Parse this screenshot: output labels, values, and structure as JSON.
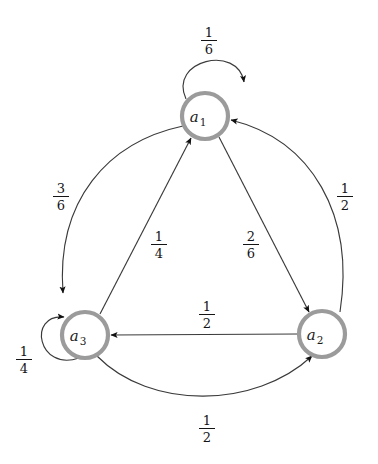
{
  "diagram": {
    "type": "state-transition-graph",
    "title": "",
    "node_style": {
      "ring_color": "#9b9b9b",
      "fill_color": "#ffffff",
      "radius": 23
    },
    "edge_color": "#3a3a3a",
    "background": "#ffffff",
    "nodes": [
      {
        "id": "a1",
        "label": "a",
        "subscript": "1",
        "cx": 205,
        "cy": 116
      },
      {
        "id": "a2",
        "label": "a",
        "subscript": "2",
        "cx": 322,
        "cy": 334
      },
      {
        "id": "a3",
        "label": "a",
        "subscript": "3",
        "cx": 85,
        "cy": 335
      }
    ],
    "edges": [
      {
        "from": "a1",
        "to": "a1",
        "kind": "self-loop",
        "numerator": "1",
        "denominator": "6",
        "label_x": 198,
        "label_y": 26
      },
      {
        "from": "a1",
        "to": "a3",
        "kind": "outer-arc",
        "numerator": "3",
        "denominator": "6",
        "label_x": 50,
        "label_y": 182
      },
      {
        "from": "a2",
        "to": "a1",
        "kind": "outer-arc",
        "numerator": "1",
        "denominator": "2",
        "label_x": 334,
        "label_y": 182
      },
      {
        "from": "a3",
        "to": "a1",
        "kind": "straight",
        "numerator": "1",
        "denominator": "4",
        "label_x": 148,
        "label_y": 230
      },
      {
        "from": "a1",
        "to": "a2",
        "kind": "straight",
        "numerator": "2",
        "denominator": "6",
        "label_x": 240,
        "label_y": 230
      },
      {
        "from": "a2",
        "to": "a3",
        "kind": "straight",
        "numerator": "1",
        "denominator": "2",
        "label_x": 196,
        "label_y": 300
      },
      {
        "from": "a3",
        "to": "a3",
        "kind": "self-loop",
        "numerator": "1",
        "denominator": "4",
        "label_x": 13,
        "label_y": 345
      },
      {
        "from": "a3",
        "to": "a2",
        "kind": "outer-arc",
        "numerator": "1",
        "denominator": "2",
        "label_x": 196,
        "label_y": 414
      }
    ]
  }
}
